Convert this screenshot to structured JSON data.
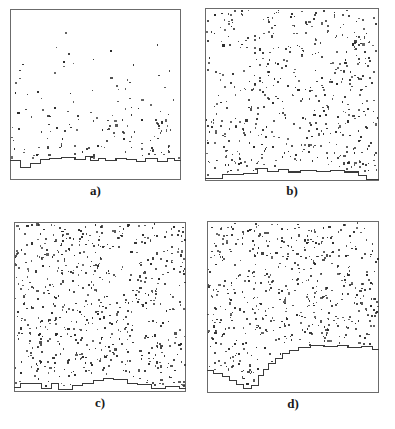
{
  "figure": {
    "type": "four-panel-scatter",
    "layout": "2x2 grid",
    "background_color": "#ffffff",
    "frame_color": "#6b6b6b",
    "dot_color": "#2b2b2b",
    "interface_color": "#3a3a3a",
    "panel_count": 4
  },
  "panels": [
    {
      "id": "a",
      "label": "a)",
      "position": "top-left",
      "box": {
        "x": 10,
        "y": 9,
        "w": 171,
        "h": 171
      },
      "label_y": 183,
      "dot_count": 150,
      "density": "sparse",
      "density_value": 0.25,
      "interface_mean_y": 0.88,
      "interface_roughness": "low",
      "dot_vertical_bias": 2.1
    },
    {
      "id": "b",
      "label": "b)",
      "position": "top-right",
      "box": {
        "x": 205,
        "y": 8,
        "w": 174,
        "h": 173
      },
      "label_y": 183,
      "dot_count": 520,
      "density": "dense",
      "density_value": 0.78,
      "interface_mean_y": 0.955,
      "interface_roughness": "very-low",
      "dot_vertical_bias": 1.05
    },
    {
      "id": "c",
      "label": "c)",
      "position": "bottom-left",
      "box": {
        "x": 14,
        "y": 222,
        "w": 172,
        "h": 170
      },
      "label_y": 395,
      "dot_count": 640,
      "density": "very-dense",
      "density_value": 0.92,
      "interface_mean_y": 0.945,
      "interface_roughness": "low",
      "dot_vertical_bias": 1.0
    },
    {
      "id": "d",
      "label": "d)",
      "position": "bottom-right",
      "box": {
        "x": 207,
        "y": 221,
        "w": 172,
        "h": 172
      },
      "label_y": 396,
      "dot_count": 560,
      "density": "dense",
      "density_value": 0.82,
      "interface_mean_y": 0.8,
      "interface_roughness": "high",
      "dot_vertical_bias": 1.0
    }
  ],
  "chart_data": {
    "type": "scatter",
    "title": "",
    "xlabel": "",
    "ylabel": "",
    "grid": false,
    "legend": null,
    "panels": [
      {
        "name": "a)",
        "description": "Sparse particle field above a shallow stepped interface near the lower edge of the box.",
        "n_points": 150,
        "xlim": [
          0,
          1
        ],
        "ylim": [
          0,
          1
        ],
        "interface": {
          "kind": "staircase",
          "x": [
            0.0,
            0.06,
            0.06,
            0.12,
            0.12,
            0.18,
            0.18,
            0.23,
            0.23,
            0.3,
            0.3,
            0.38,
            0.38,
            0.44,
            0.44,
            0.47,
            0.47,
            0.52,
            0.52,
            0.56,
            0.56,
            0.62,
            0.62,
            0.68,
            0.68,
            0.74,
            0.74,
            0.79,
            0.79,
            0.86,
            0.86,
            0.92,
            0.92,
            0.96,
            0.96,
            1.0
          ],
          "y": [
            0.885,
            0.885,
            0.925,
            0.925,
            0.905,
            0.905,
            0.88,
            0.88,
            0.872,
            0.872,
            0.866,
            0.866,
            0.878,
            0.878,
            0.86,
            0.86,
            0.888,
            0.888,
            0.872,
            0.872,
            0.884,
            0.884,
            0.872,
            0.872,
            0.88,
            0.88,
            0.89,
            0.89,
            0.876,
            0.876,
            0.892,
            0.892,
            0.874,
            0.874,
            0.886,
            0.886
          ]
        }
      },
      {
        "name": "b)",
        "description": "Dense uniform particle field with a nearly flat interface hugging the bottom of the box.",
        "n_points": 520,
        "xlim": [
          0,
          1
        ],
        "ylim": [
          0,
          1
        ],
        "interface": {
          "kind": "staircase",
          "x": [
            0.0,
            0.1,
            0.1,
            0.22,
            0.22,
            0.3,
            0.3,
            0.36,
            0.36,
            0.42,
            0.42,
            0.48,
            0.48,
            0.55,
            0.55,
            0.64,
            0.64,
            0.72,
            0.72,
            0.8,
            0.8,
            0.88,
            0.88,
            0.93,
            0.93,
            1.0
          ],
          "y": [
            0.985,
            0.985,
            0.962,
            0.962,
            0.958,
            0.958,
            0.93,
            0.93,
            0.945,
            0.945,
            0.932,
            0.932,
            0.948,
            0.948,
            0.94,
            0.94,
            0.944,
            0.944,
            0.94,
            0.94,
            0.948,
            0.948,
            0.968,
            0.968,
            0.99,
            0.99
          ]
        }
      },
      {
        "name": "c)",
        "description": "Very dense particle field with a low interface showing small plateaus and a broad central bump.",
        "n_points": 640,
        "xlim": [
          0,
          1
        ],
        "ylim": [
          0,
          1
        ],
        "interface": {
          "kind": "staircase",
          "x": [
            0.0,
            0.04,
            0.04,
            0.16,
            0.16,
            0.22,
            0.22,
            0.26,
            0.26,
            0.34,
            0.34,
            0.4,
            0.4,
            0.46,
            0.46,
            0.52,
            0.52,
            0.58,
            0.58,
            0.66,
            0.66,
            0.72,
            0.72,
            0.8,
            0.8,
            0.88,
            0.88,
            0.96,
            0.96,
            1.0
          ],
          "y": [
            0.975,
            0.975,
            0.948,
            0.948,
            0.982,
            0.982,
            0.952,
            0.952,
            0.986,
            0.986,
            0.964,
            0.964,
            0.95,
            0.95,
            0.93,
            0.93,
            0.918,
            0.918,
            0.928,
            0.928,
            0.948,
            0.948,
            0.958,
            0.958,
            0.982,
            0.982,
            0.966,
            0.966,
            0.98,
            0.98
          ]
        }
      },
      {
        "name": "d)",
        "description": "Dense particle field with a strongly rough interface: a descending staircase on the left, a deep trough near x=0.25, then a steep rise to a high plateau on the right.",
        "n_points": 560,
        "xlim": [
          0,
          1
        ],
        "ylim": [
          0,
          1
        ],
        "interface": {
          "kind": "staircase",
          "x": [
            0.0,
            0.04,
            0.04,
            0.09,
            0.09,
            0.13,
            0.13,
            0.17,
            0.17,
            0.21,
            0.21,
            0.26,
            0.26,
            0.3,
            0.3,
            0.33,
            0.33,
            0.36,
            0.36,
            0.4,
            0.4,
            0.44,
            0.44,
            0.48,
            0.48,
            0.53,
            0.53,
            0.6,
            0.6,
            0.68,
            0.68,
            0.76,
            0.76,
            0.82,
            0.82,
            0.9,
            0.9,
            0.96,
            0.96,
            1.0
          ],
          "y": [
            0.87,
            0.87,
            0.886,
            0.886,
            0.906,
            0.906,
            0.928,
            0.928,
            0.948,
            0.948,
            0.972,
            0.972,
            0.958,
            0.958,
            0.9,
            0.9,
            0.862,
            0.862,
            0.83,
            0.83,
            0.8,
            0.8,
            0.772,
            0.772,
            0.752,
            0.752,
            0.736,
            0.736,
            0.726,
            0.726,
            0.732,
            0.732,
            0.724,
            0.724,
            0.736,
            0.736,
            0.728,
            0.728,
            0.748,
            0.748
          ]
        }
      }
    ]
  }
}
